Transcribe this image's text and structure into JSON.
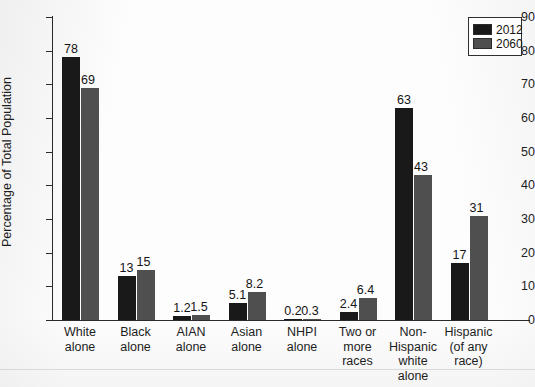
{
  "chart_data": {
    "type": "bar",
    "title": "",
    "subtitle": "",
    "xlabel": "",
    "ylabel": "Percentage of Total Population",
    "ylim": [
      0,
      90
    ],
    "yticks": [
      0,
      10,
      20,
      30,
      40,
      50,
      60,
      70,
      80,
      90
    ],
    "grid": false,
    "legend_position": "top-right",
    "categories": [
      "White alone",
      "Black alone",
      "AIAN alone",
      "Asian alone",
      "NHPI alone",
      "Two or more races",
      "Non-Hispanic white alone",
      "Hispanic (of any race)"
    ],
    "category_lines": [
      [
        "White",
        "alone"
      ],
      [
        "Black",
        "alone"
      ],
      [
        "AIAN",
        "alone"
      ],
      [
        "Asian",
        "alone"
      ],
      [
        "NHPI",
        "alone"
      ],
      [
        "Two or",
        "more",
        "races"
      ],
      [
        "Non-",
        "Hispanic",
        "white",
        "alone"
      ],
      [
        "Hispanic",
        "(of any",
        "race)"
      ]
    ],
    "series": [
      {
        "name": "2012",
        "color": "#191919",
        "values": [
          78,
          13,
          1.2,
          5.1,
          0.2,
          2.4,
          63,
          17
        ],
        "labels": [
          "78",
          "13",
          "1.2",
          "5.1",
          "0.2",
          "2.4",
          "63",
          "17"
        ]
      },
      {
        "name": "2060",
        "color": "#4f4f4f",
        "values": [
          69,
          15,
          1.5,
          8.2,
          0.3,
          6.4,
          43,
          31
        ],
        "labels": [
          "69",
          "15",
          "1.5",
          "8.2",
          "0.3",
          "6.4",
          "43",
          "31"
        ]
      }
    ]
  },
  "legend": {
    "items": [
      {
        "label": "2012",
        "color": "#191919"
      },
      {
        "label": "2060",
        "color": "#4f4f4f"
      }
    ]
  }
}
